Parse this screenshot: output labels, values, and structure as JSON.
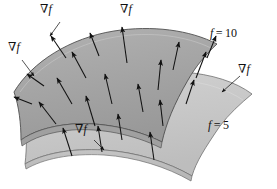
{
  "figure": {
    "type": "level-surface-gradient-diagram",
    "background_color": "#ffffff",
    "upper_surface": {
      "name": "f = 10 level surface",
      "fill_color": "#a6a6a6",
      "stroke_color": "#4a4a4a",
      "label": {
        "symbol": "f",
        "equals": "=",
        "value": "10",
        "full": "f = 10"
      }
    },
    "lower_surface": {
      "name": "f = 5 level surface",
      "fill_color": "#c9c9c9",
      "stroke_color": "#6e6e6e",
      "label": {
        "symbol": "f",
        "equals": "=",
        "value": "5",
        "full": "f = 5"
      }
    },
    "gradient_symbol": {
      "nabla": "∇",
      "f": "f",
      "full": "∇f"
    },
    "gradient_labels": [
      {
        "id": "grad-top-left",
        "text": "∇f",
        "x": 45,
        "y": 8
      },
      {
        "id": "grad-top-center",
        "text": "∇f",
        "x": 124,
        "y": 8
      },
      {
        "id": "grad-left",
        "text": "∇f",
        "x": 10,
        "y": 46
      },
      {
        "id": "grad-right",
        "text": "∇f",
        "x": 240,
        "y": 68
      },
      {
        "id": "grad-bottom-mid",
        "text": "∇f",
        "x": 79,
        "y": 127
      }
    ],
    "level_labels": [
      {
        "id": "label-f-10",
        "text": "f = 10",
        "x": 212,
        "y": 33
      },
      {
        "id": "label-f-5",
        "text": "f = 5",
        "x": 210,
        "y": 124
      }
    ],
    "arrow_color": "#111111",
    "arrow_count": 21
  }
}
